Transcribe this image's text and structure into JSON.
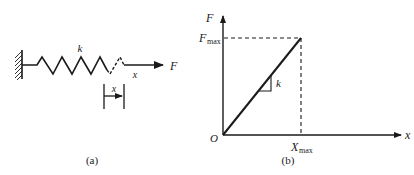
{
  "figure_a": {
    "caption": "(a)",
    "spring_label": "k",
    "force_label": "F",
    "displacement_label": "x",
    "bracket_label": "x"
  },
  "figure_b": {
    "caption": "(b)",
    "y_axis_label": "F",
    "x_axis_label": "x",
    "origin_label": "O",
    "y_max_label_main": "F",
    "y_max_label_sub": "max",
    "x_max_label_main": "X",
    "x_max_label_sub": "max",
    "slope_label": "k"
  },
  "colors": {
    "ink": "#1a1a1a",
    "background": "#ffffff"
  }
}
